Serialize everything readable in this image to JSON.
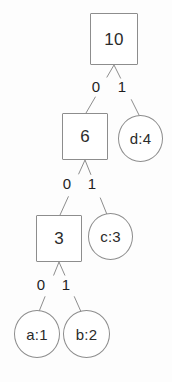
{
  "diagram": {
    "stroke_color": "#8d8d8d",
    "text_color": "#2b2b2b",
    "background_color": "#fdfdfd"
  },
  "nodes": [
    {
      "id": "root",
      "label": "10",
      "shape": "square",
      "x": 90,
      "y": 13,
      "w": 48,
      "h": 52
    },
    {
      "id": "n6",
      "label": "6",
      "shape": "square",
      "x": 62,
      "y": 113,
      "w": 46,
      "h": 47
    },
    {
      "id": "d",
      "label": "d:4",
      "shape": "circle",
      "x": 118,
      "y": 115,
      "w": 45,
      "h": 47
    },
    {
      "id": "n3",
      "label": "3",
      "shape": "square",
      "x": 36,
      "y": 215,
      "w": 46,
      "h": 47
    },
    {
      "id": "c",
      "label": "c:3",
      "shape": "circle",
      "x": 88,
      "y": 213,
      "w": 45,
      "h": 47
    },
    {
      "id": "a",
      "label": "a:1",
      "shape": "circle",
      "x": 14,
      "y": 310,
      "w": 46,
      "h": 48
    },
    {
      "id": "b",
      "label": "b:2",
      "shape": "circle",
      "x": 63,
      "y": 310,
      "w": 47,
      "h": 48
    }
  ],
  "edges": [
    {
      "from": "root",
      "to": "n6",
      "bit": "0",
      "x1": 114,
      "y1": 65,
      "x2": 86,
      "y2": 113,
      "lx": 96,
      "ly": 79
    },
    {
      "from": "root",
      "to": "d",
      "bit": "1",
      "x1": 114,
      "y1": 65,
      "x2": 140,
      "y2": 117,
      "lx": 122,
      "ly": 79
    },
    {
      "from": "n6",
      "to": "n3",
      "bit": "0",
      "x1": 85,
      "y1": 160,
      "x2": 60,
      "y2": 215,
      "lx": 67,
      "ly": 176
    },
    {
      "from": "n6",
      "to": "c",
      "bit": "1",
      "x1": 85,
      "y1": 160,
      "x2": 108,
      "y2": 217,
      "lx": 92,
      "ly": 176
    },
    {
      "from": "n3",
      "to": "a",
      "bit": "0",
      "x1": 59,
      "y1": 262,
      "x2": 38,
      "y2": 314,
      "lx": 41,
      "ly": 277
    },
    {
      "from": "n3",
      "to": "b",
      "bit": "1",
      "x1": 59,
      "y1": 262,
      "x2": 82,
      "y2": 314,
      "lx": 66,
      "ly": 277
    }
  ]
}
